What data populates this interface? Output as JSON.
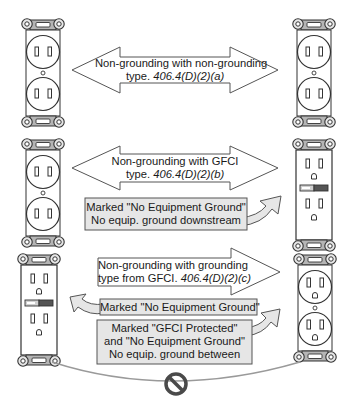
{
  "diagram": {
    "rows": [
      {
        "id": "row-a",
        "arrow_line1": "Non-grounding with non-grounding",
        "arrow_line2_prefix": "type. ",
        "arrow_line2_ref": "406.4(D)(2)(a)",
        "left_outlet": "non-grounding duplex",
        "right_outlet": "non-grounding duplex"
      },
      {
        "id": "row-b",
        "arrow_line1": "Non-grounding with GFCI",
        "arrow_line2_prefix": "type. ",
        "arrow_line2_ref": "406.4(D)(2)(b)",
        "note_line1": "Marked \"No Equipment Ground\"",
        "note_line2": "No equip. ground downstream",
        "left_outlet": "non-grounding duplex",
        "right_outlet": "GFCI receptacle"
      },
      {
        "id": "row-c",
        "arrow_line1": "Non-grounding with grounding",
        "arrow_line2_prefix": "type from GFCI. ",
        "arrow_line2_ref": "406.4(D)(2)(c)",
        "note_left": "Marked \"No Equipment Ground\"",
        "note_right_line1": "Marked \"GFCI Protected\"",
        "note_right_line2": "and \"No Equipment Ground\"",
        "note_right_line3": "No equip. ground between",
        "left_outlet": "GFCI receptacle",
        "right_outlet": "grounding duplex",
        "prohibited_symbol": "no-symbol"
      }
    ],
    "colors": {
      "outline": "#333333",
      "strap": "#b5b5b5",
      "arrow_fill": "#ffffff",
      "note_fill": "#e6e6e6",
      "wire": "#9a9a9a",
      "prohibit": "#4a4a4a"
    }
  }
}
